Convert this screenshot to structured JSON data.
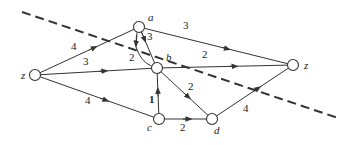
{
  "diagram": {
    "type": "flow-network",
    "nodes": [
      {
        "id": "z_src",
        "label": "z",
        "x": 35,
        "y": 75,
        "lx": 21,
        "ly": 79
      },
      {
        "id": "a",
        "label": "a",
        "x": 139,
        "y": 27,
        "lx": 148,
        "ly": 21
      },
      {
        "id": "b",
        "label": "b",
        "x": 157,
        "y": 68,
        "lx": 166,
        "ly": 61
      },
      {
        "id": "c",
        "label": "c",
        "x": 159,
        "y": 119,
        "lx": 147,
        "ly": 131
      },
      {
        "id": "d",
        "label": "d",
        "x": 212,
        "y": 119,
        "lx": 214,
        "ly": 134
      },
      {
        "id": "z_sink",
        "label": "z",
        "x": 293,
        "y": 65,
        "lx": 304,
        "ly": 69
      }
    ],
    "edges": [
      {
        "from": "z_src",
        "to": "a",
        "weight": "4",
        "lx": 71,
        "ly": 50,
        "bold": false
      },
      {
        "from": "z_src",
        "to": "b",
        "weight": "3",
        "lx": 83,
        "ly": 65,
        "bold": false
      },
      {
        "from": "z_src",
        "to": "c",
        "weight": "4",
        "lx": 85,
        "ly": 104,
        "bold": false
      },
      {
        "from": "a",
        "to": "z_sink",
        "weight": "3",
        "lx": 183,
        "ly": 29,
        "bold": false
      },
      {
        "from": "a",
        "to": "b",
        "weight": "2",
        "lx": 129,
        "ly": 61,
        "bold": false
      },
      {
        "from": "b",
        "to": "a",
        "weight": "3",
        "lx": 147,
        "ly": 40,
        "bold": false
      },
      {
        "from": "b",
        "to": "z_sink",
        "weight": "2",
        "lx": 202,
        "ly": 58,
        "bold": false
      },
      {
        "from": "b",
        "to": "d",
        "weight": "2",
        "lx": 188,
        "ly": 90,
        "bold": false
      },
      {
        "from": "c",
        "to": "b",
        "weight": "1",
        "lx": 149,
        "ly": 103,
        "bold": true
      },
      {
        "from": "c",
        "to": "d",
        "weight": "2",
        "lx": 180,
        "ly": 131,
        "bold": false
      },
      {
        "from": "d",
        "to": "z_sink",
        "weight": "4",
        "lx": 243,
        "ly": 112,
        "bold": false
      }
    ],
    "cut_line": {
      "x1": 22,
      "y1": 12,
      "x2": 338,
      "y2": 118,
      "style": "dashed"
    },
    "colors": {
      "stroke": "#333333",
      "node_fill": "#ffffff",
      "text": "#222222"
    }
  }
}
